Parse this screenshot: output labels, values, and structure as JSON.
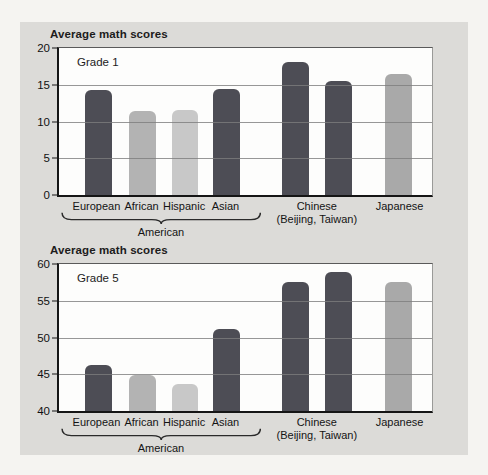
{
  "figure": {
    "kind": "two-panel grouped bar chart",
    "colors": {
      "page_background": "#f5f4f1",
      "panel_background": "#dcdbd8",
      "plot_background": "#fdfdfc",
      "bar_dark": "#4d4d55",
      "bar_african": "#b3b3b3",
      "bar_hispanic": "#c8c8c8",
      "bar_japanese": "#a9a9a9",
      "gridline": "#7d7d7d",
      "axis": "#151515"
    }
  },
  "chart_data": [
    {
      "type": "bar",
      "title": "Average math scores",
      "panel_label": "Grade 1",
      "ylabel": "",
      "xlabel": "",
      "ylim": [
        0,
        20
      ],
      "yticks": [
        20,
        15,
        10,
        5,
        0
      ],
      "grid": "horizontal lines at 5, 10, 15 drawn over bars",
      "legend": "none",
      "series": [
        {
          "label": "European American",
          "value": 14.0,
          "color": "bar_dark"
        },
        {
          "label": "African American",
          "value": 11.2,
          "color": "bar_african"
        },
        {
          "label": "Hispanic American",
          "value": 11.4,
          "color": "bar_hispanic"
        },
        {
          "label": "Asian American",
          "value": 14.2,
          "color": "bar_dark"
        },
        {
          "label": "Chinese (Beijing)",
          "value": 17.8,
          "color": "bar_dark"
        },
        {
          "label": "Chinese (Taiwan)",
          "value": 15.2,
          "color": "bar_dark"
        },
        {
          "label": "Japanese",
          "value": 16.2,
          "color": "bar_japanese"
        }
      ],
      "x_labels": [
        {
          "text": "European",
          "anchor": "0"
        },
        {
          "text": "African",
          "anchor": "1"
        },
        {
          "text": "Hispanic",
          "anchor": "2"
        },
        {
          "text": "Asian",
          "anchor": "3"
        },
        {
          "text": "Chinese",
          "text2": "(Beijing, Taiwan)",
          "anchor": "4-5"
        },
        {
          "text": "Japanese",
          "anchor": "6"
        }
      ],
      "group_underbrace": {
        "label": "American",
        "from": 0,
        "to": 3
      }
    },
    {
      "type": "bar",
      "title": "Average math scores",
      "panel_label": "Grade 5",
      "ylabel": "",
      "xlabel": "",
      "ylim": [
        40,
        60
      ],
      "yticks": [
        60,
        55,
        50,
        45,
        40
      ],
      "grid": "horizontal lines at 45, 50, 55 drawn over bars",
      "legend": "none",
      "series": [
        {
          "label": "European American",
          "value": 46.2,
          "color": "bar_dark"
        },
        {
          "label": "African American",
          "value": 44.8,
          "color": "bar_african"
        },
        {
          "label": "Hispanic American",
          "value": 43.6,
          "color": "bar_hispanic"
        },
        {
          "label": "Asian American",
          "value": 51.0,
          "color": "bar_dark"
        },
        {
          "label": "Chinese (Beijing)",
          "value": 57.2,
          "color": "bar_dark"
        },
        {
          "label": "Chinese (Taiwan)",
          "value": 58.6,
          "color": "bar_dark"
        },
        {
          "label": "Japanese",
          "value": 57.2,
          "color": "bar_japanese"
        }
      ],
      "x_labels": [
        {
          "text": "European",
          "anchor": "0"
        },
        {
          "text": "African",
          "anchor": "1"
        },
        {
          "text": "Hispanic",
          "anchor": "2"
        },
        {
          "text": "Asian",
          "anchor": "3"
        },
        {
          "text": "Chinese",
          "text2": "(Beijing, Taiwan)",
          "anchor": "4-5"
        },
        {
          "text": "Japanese",
          "anchor": "6"
        }
      ],
      "group_underbrace": {
        "label": "American",
        "from": 0,
        "to": 3
      }
    }
  ]
}
